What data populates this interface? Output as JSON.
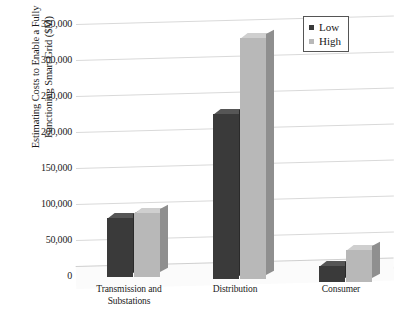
{
  "chart_data": {
    "type": "bar",
    "title": "",
    "subtitle": "",
    "xlabel": "",
    "ylabel": "Estimating Costs to Enable a Fully Functioning Smart Grid ($M)",
    "ylabel_lines": [
      "Estimating Costs to Enable a Fully",
      "Functioning Smart Grid ($M)"
    ],
    "categories": [
      "Transmission and Substations",
      "Distribution",
      "Consumer"
    ],
    "category_lines": [
      [
        "Transmission and",
        "Substations"
      ],
      [
        "Distribution"
      ],
      [
        "Consumer"
      ]
    ],
    "series": [
      {
        "name": "Low",
        "values": [
          82000,
          230000,
          22000
        ],
        "color": "#3a3a3a"
      },
      {
        "name": "High",
        "values": [
          88000,
          335000,
          44000
        ],
        "color": "#b8b8b8"
      }
    ],
    "ylim": [
      0,
      350000
    ],
    "yticks": [
      0,
      50000,
      100000,
      150000,
      200000,
      250000,
      300000,
      350000
    ],
    "ytick_labels": [
      "0",
      "50,000",
      "100,000",
      "150,000",
      "200,000",
      "250,000",
      "300,000",
      "350,000"
    ],
    "grid": true,
    "legend_position": "top-right",
    "style": "3d-column"
  },
  "legend": {
    "items": [
      {
        "label": "Low",
        "swatch": "legend-swatch-low"
      },
      {
        "label": "High",
        "swatch": "legend-swatch-high"
      }
    ]
  },
  "colors": {
    "low": "#3a3a3a",
    "high": "#b8b8b8",
    "gridline": "#d9d9d9",
    "background": "#ffffff",
    "text": "#1a1a1a"
  }
}
